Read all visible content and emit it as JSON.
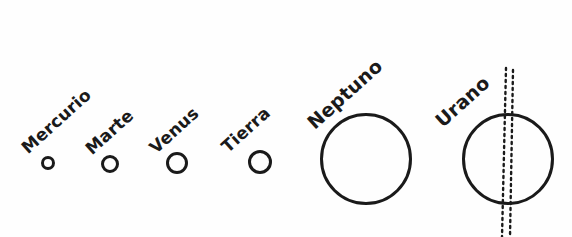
{
  "diagram": {
    "language": "es",
    "background_color": "#fefefe",
    "ink_color": "#1a1a1a",
    "width": 572,
    "height": 237
  },
  "planets": [
    {
      "name": "Mercurio",
      "label": "Mercurio",
      "label_x": 24,
      "label_y": 140,
      "label_rotation": -42,
      "label_font_size": 17,
      "circle_cx": 48,
      "circle_cy": 163,
      "circle_r": 7,
      "stroke_width": 3,
      "has_axis": false
    },
    {
      "name": "Marte",
      "label": "Marte",
      "label_x": 88,
      "label_y": 141,
      "label_rotation": -42,
      "label_font_size": 17,
      "circle_cx": 110,
      "circle_cy": 164,
      "circle_r": 9,
      "stroke_width": 3,
      "has_axis": false
    },
    {
      "name": "Venus",
      "label": "Venus",
      "label_x": 152,
      "label_y": 140,
      "label_rotation": -42,
      "label_font_size": 17,
      "circle_cx": 177,
      "circle_cy": 163,
      "circle_r": 11,
      "stroke_width": 3,
      "has_axis": false
    },
    {
      "name": "Tierra",
      "label": "Tierra",
      "label_x": 224,
      "label_y": 139,
      "label_rotation": -42,
      "label_font_size": 17,
      "circle_cx": 260,
      "circle_cy": 162,
      "circle_r": 12,
      "stroke_width": 3,
      "has_axis": false
    },
    {
      "name": "Neptuno",
      "label": "Neptuno",
      "label_x": 310,
      "label_y": 114,
      "label_rotation": -42,
      "label_font_size": 19,
      "circle_cx": 366,
      "circle_cy": 159,
      "circle_r": 46,
      "stroke_width": 3,
      "has_axis": false
    },
    {
      "name": "Urano",
      "label": "Urano",
      "label_x": 438,
      "label_y": 112,
      "label_rotation": -42,
      "label_font_size": 19,
      "circle_cx": 508,
      "circle_cy": 159,
      "circle_r": 46,
      "stroke_width": 3,
      "has_axis": true,
      "axis_style": "dotted",
      "axis_description": "eje de rotación inclinado trazado con línea punteada doble"
    }
  ],
  "axis_lines": [
    {
      "x1": 506,
      "y1": 68,
      "x2": 502,
      "y2": 237,
      "dash": "2 4",
      "width": 2.4
    },
    {
      "x1": 513,
      "y1": 70,
      "x2": 510,
      "y2": 237,
      "dash": "2 4",
      "width": 2.4
    }
  ]
}
